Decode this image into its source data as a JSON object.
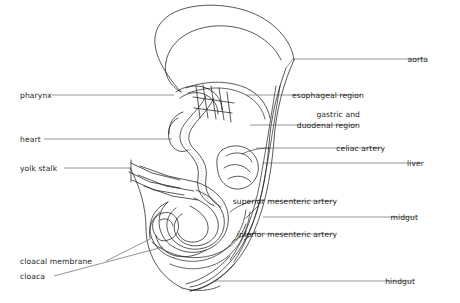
{
  "figure": {
    "background_color": "#ffffff",
    "ink_color": "#231f20",
    "leader_color": "#58595b"
  },
  "labels_left": [
    {
      "id": "pharynx",
      "text": "pharynx",
      "x": 20,
      "y": 91,
      "leader_x1": 52,
      "leader_y1": 95,
      "leader_x2": 174,
      "leader_y2": 95
    },
    {
      "id": "heart",
      "text": "heart",
      "x": 20,
      "y": 135,
      "leader_x1": 44,
      "leader_y1": 139,
      "leader_x2": 172,
      "leader_y2": 139
    },
    {
      "id": "yolk-stalk",
      "text": "yolk stalk",
      "x": 20,
      "y": 164,
      "leader_x1": 64,
      "leader_y1": 168,
      "leader_x2": 131,
      "leader_y2": 168
    },
    {
      "id": "cloacal-membrane",
      "text": "cloacal membrane",
      "x": 20,
      "y": 257,
      "leader_x1": 106,
      "leader_y1": 261,
      "leader_x2": 152,
      "leader_y2": 238
    },
    {
      "id": "cloaca",
      "text": "cloaca",
      "x": 20,
      "y": 272,
      "leader_x1": 54,
      "leader_y1": 276,
      "leader_x2": 163,
      "leader_y2": 247
    }
  ],
  "labels_right": [
    {
      "id": "aorta",
      "text": "aorta",
      "x": 428,
      "y": 55,
      "leader_x1": 425,
      "leader_y1": 59,
      "leader_x2": 293,
      "leader_y2": 59,
      "hook_x": 286,
      "hook_y": 68
    },
    {
      "id": "esophageal-region",
      "text": "esophageal region",
      "x": 364,
      "y": 91,
      "leader_x1": 361,
      "leader_y1": 95,
      "leader_x2": 246,
      "leader_y2": 95
    },
    {
      "id": "gastric-and-duodenal-region",
      "text": "gastric and\nduodenal region",
      "x": 360,
      "y": 110,
      "leader_x1": 357,
      "leader_y1": 125,
      "leader_x2": 250,
      "leader_y2": 125
    },
    {
      "id": "celiac-artery",
      "text": "celiac artery",
      "x": 385,
      "y": 144,
      "leader_x1": 382,
      "leader_y1": 148,
      "leader_x2": 256,
      "leader_y2": 148
    },
    {
      "id": "liver",
      "text": "liver",
      "x": 424,
      "y": 159,
      "leader_x1": 421,
      "leader_y1": 163,
      "leader_x2": 262,
      "leader_y2": 163
    },
    {
      "id": "superior-mesenteric-artery",
      "text": "superior mesenteric artery",
      "x": 337,
      "y": 197,
      "leader_x1": 334,
      "leader_y1": 201,
      "leader_x2": 268,
      "leader_y2": 201
    },
    {
      "id": "midgut",
      "text": "midgut",
      "x": 418,
      "y": 213,
      "leader_x1": 415,
      "leader_y1": 217,
      "leader_x2": 263,
      "leader_y2": 217
    },
    {
      "id": "inferior-mesenteric-artery",
      "text": "inferior mesenteric artery",
      "x": 337,
      "y": 230,
      "leader_x1": 334,
      "leader_y1": 234,
      "leader_x2": 264,
      "leader_y2": 234
    },
    {
      "id": "hindgut",
      "text": "hindgut",
      "x": 415,
      "y": 277,
      "leader_x1": 412,
      "leader_y1": 281,
      "leader_x2": 213,
      "leader_y2": 281
    }
  ]
}
